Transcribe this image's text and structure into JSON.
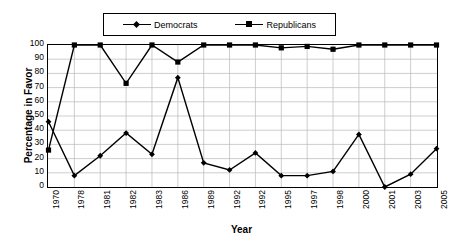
{
  "chart_data": {
    "type": "line",
    "title": "",
    "xlabel": "Year",
    "ylabel": "Percentage in Favor",
    "categories": [
      "1970",
      "1978",
      "1981",
      "1982",
      "1983",
      "1986",
      "1989",
      "1992",
      "1992",
      "1995",
      "1997",
      "1998",
      "2000",
      "2001",
      "2003",
      "2005"
    ],
    "ylim": [
      0,
      100
    ],
    "ytick_step": 10,
    "yticks": [
      "100",
      "90",
      "80",
      "70",
      "60",
      "50",
      "40",
      "30",
      "20",
      "10",
      "0"
    ],
    "grid": "horizontal-and-vertical",
    "legend_position": "top-center",
    "series": [
      {
        "name": "Democrats",
        "marker": "diamond",
        "color": "#000000",
        "values": [
          46,
          8,
          22,
          38,
          23,
          77,
          17,
          12,
          24,
          8,
          8,
          11,
          37,
          0,
          9,
          27
        ]
      },
      {
        "name": "Republicans",
        "marker": "square",
        "color": "#000000",
        "values": [
          26,
          100,
          100,
          73,
          100,
          88,
          100,
          100,
          100,
          98,
          99,
          97,
          100,
          100,
          100,
          100
        ]
      }
    ]
  },
  "legend": {
    "items": [
      {
        "label": "Democrats",
        "marker": "diamond"
      },
      {
        "label": "Republicans",
        "marker": "square"
      }
    ]
  },
  "axes": {
    "y_title": "Percentage in Favor",
    "x_title": "Year"
  }
}
